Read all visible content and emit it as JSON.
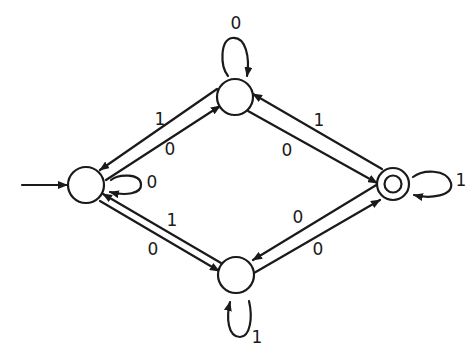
{
  "diagram": {
    "type": "finite-automaton",
    "colors": {
      "ink": "#1a1a1a",
      "background": "#ffffff"
    },
    "states": [
      {
        "id": "s_left",
        "role": "start",
        "accepting": false,
        "cx": 86,
        "cy": 185,
        "r": 18
      },
      {
        "id": "s_top",
        "role": "normal",
        "accepting": false,
        "cx": 235,
        "cy": 97,
        "r": 18
      },
      {
        "id": "s_right",
        "role": "final",
        "accepting": true,
        "cx": 393,
        "cy": 184,
        "r": 16
      },
      {
        "id": "s_bottom",
        "role": "normal",
        "accepting": false,
        "cx": 236,
        "cy": 275,
        "r": 18
      }
    ],
    "transitions": [
      {
        "from": "s_left",
        "to": "s_left",
        "label": "0"
      },
      {
        "from": "s_top",
        "to": "s_top",
        "label": "0"
      },
      {
        "from": "s_right",
        "to": "s_right",
        "label": "1"
      },
      {
        "from": "s_bottom",
        "to": "s_bottom",
        "label": "1"
      },
      {
        "from": "s_top",
        "to": "s_left",
        "label": "1"
      },
      {
        "from": "s_left",
        "to": "s_top",
        "label": "0"
      },
      {
        "from": "s_right",
        "to": "s_top",
        "label": "1"
      },
      {
        "from": "s_top",
        "to": "s_right",
        "label": "0"
      },
      {
        "from": "s_bottom",
        "to": "s_left",
        "label": "1"
      },
      {
        "from": "s_left",
        "to": "s_bottom",
        "label": "0"
      },
      {
        "from": "s_right",
        "to": "s_bottom",
        "label": "0"
      },
      {
        "from": "s_bottom",
        "to": "s_right",
        "label": "0"
      }
    ],
    "labels": {
      "loop_left": "0",
      "loop_top": "0",
      "loop_right": "1",
      "loop_bottom": "1",
      "top_to_left": "1",
      "left_to_top": "0",
      "right_to_top": "1",
      "top_to_right": "0",
      "bottom_to_left": "1",
      "left_to_bottom": "0",
      "right_to_bottom": "0",
      "bottom_to_right": "0"
    }
  }
}
